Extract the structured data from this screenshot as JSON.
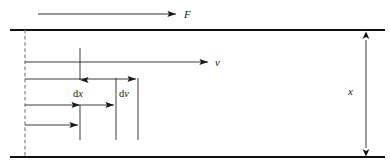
{
  "figure": {
    "background_color": "#ffffff",
    "line_color": "#1a1a1a",
    "boundary_color": "#111111",
    "dashed_color": "#7a7a7a",
    "width": 390,
    "height": 166
  },
  "labels": {
    "force": "F",
    "velocity": "v",
    "thickness": "x",
    "dx_d": "d",
    "dx_x": "x",
    "dv_d": "d",
    "dv_v": "v"
  },
  "geometry": {
    "top_plate": {
      "x1": 10,
      "y": 30,
      "x2": 385
    },
    "bottom_plate": {
      "x1": 10,
      "y": 157,
      "x2": 385
    },
    "reference_line": {
      "x": 25,
      "y1": 30,
      "y2": 158
    },
    "force_arrow": {
      "x1": 38,
      "x2": 178,
      "y": 14
    },
    "velocity_profile_arrows": [
      {
        "x1": 25,
        "x2": 210,
        "y": 62
      },
      {
        "x1": 25,
        "x2": 138,
        "y": 79
      },
      {
        "x1": 25,
        "x2": 116,
        "y": 105
      },
      {
        "x1": 25,
        "x2": 80,
        "y": 125
      }
    ],
    "dx_down_arrow": {
      "x": 80,
      "y1": 48,
      "y2": 82
    },
    "dx_up_arrow": {
      "x": 80,
      "y1": 140,
      "y2": 103
    },
    "dv_left_line": {
      "x": 116,
      "y1": 78,
      "y2": 140
    },
    "dv_right_line": {
      "x": 138,
      "y1": 78,
      "y2": 140
    },
    "thickness_arrow": {
      "x": 366,
      "y1": 32,
      "y2": 156
    }
  },
  "label_positions": {
    "force": {
      "x": 184,
      "y": 18
    },
    "velocity": {
      "x": 215,
      "y": 66
    },
    "thickness": {
      "x": 348,
      "y": 94
    },
    "dx": {
      "x": 73,
      "y": 97
    },
    "dv": {
      "x": 119,
      "y": 97
    }
  }
}
